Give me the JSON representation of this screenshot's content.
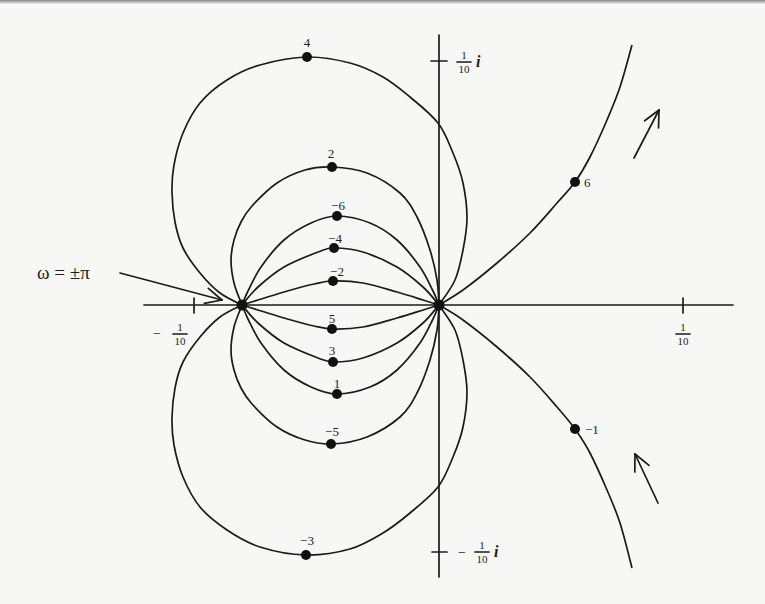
{
  "figure": {
    "annotation": {
      "text": "ω = ±π",
      "text_at": [
        37,
        279
      ],
      "arrow": {
        "from": [
          120,
          273
        ],
        "to": [
          222,
          300
        ]
      }
    },
    "axes": {
      "real": {
        "from": [
          144,
          305
        ],
        "to": [
          733,
          305
        ]
      },
      "imaginary": {
        "from": [
          439,
          35
        ],
        "to": [
          439,
          577
        ]
      },
      "origin": [
        439,
        305
      ],
      "scale_px_per_tenth": 245
    },
    "ticks": [
      {
        "name": "tick-real-minus-tenth",
        "line": [
          [
            194,
            298
          ],
          [
            194,
            313
          ]
        ],
        "sign": "−",
        "sign_at": [
          157,
          338
        ],
        "num": "1",
        "den": "10",
        "frac_x": 180,
        "bar_y": 334,
        "suffix": "",
        "suffix_at": [
          0,
          0
        ]
      },
      {
        "name": "tick-real-plus-tenth",
        "line": [
          [
            683,
            298
          ],
          [
            683,
            313
          ]
        ],
        "sign": "",
        "sign_at": [
          0,
          0
        ],
        "num": "1",
        "den": "10",
        "frac_x": 683,
        "bar_y": 334,
        "suffix": "",
        "suffix_at": [
          0,
          0
        ]
      },
      {
        "name": "tick-imag-plus-tenth",
        "line": [
          [
            431,
            61
          ],
          [
            447,
            61
          ]
        ],
        "sign": "",
        "sign_at": [
          0,
          0
        ],
        "num": "1",
        "den": "10",
        "frac_x": 464,
        "bar_y": 62,
        "suffix": "i",
        "suffix_at": [
          476,
          67
        ]
      },
      {
        "name": "tick-imag-minus-tenth",
        "line": [
          [
            432,
            552
          ],
          [
            447,
            552
          ]
        ],
        "sign": "−",
        "sign_at": [
          462,
          557
        ],
        "num": "1",
        "den": "10",
        "frac_x": 482,
        "bar_y": 552,
        "suffix": "i",
        "suffix_at": [
          494,
          557
        ]
      }
    ],
    "special_points": [
      {
        "name": "point-omega-pm-pi",
        "at": [
          242,
          305
        ]
      },
      {
        "name": "point-origin",
        "at": [
          439,
          305
        ]
      }
    ],
    "curves": [
      {
        "label": "4",
        "dot": [
          307,
          57
        ],
        "label_at": [
          307,
          47
        ],
        "anchor": "middle",
        "points": [
          [
            242,
            305
          ],
          [
            220,
            293
          ],
          [
            200,
            273
          ],
          [
            183,
            248
          ],
          [
            175,
            222
          ],
          [
            172,
            192
          ],
          [
            174,
            165
          ],
          [
            183,
            133
          ],
          [
            200,
            103
          ],
          [
            227,
            80
          ],
          [
            260,
            65
          ],
          [
            307,
            57
          ],
          [
            350,
            63
          ],
          [
            383,
            77
          ],
          [
            410,
            97
          ],
          [
            438,
            123
          ],
          [
            453,
            153
          ],
          [
            463,
            183
          ],
          [
            467,
            218
          ],
          [
            463,
            250
          ],
          [
            455,
            280
          ],
          [
            439,
            305
          ]
        ]
      },
      {
        "label": "2",
        "dot": [
          332,
          167
        ],
        "label_at": [
          331,
          158
        ],
        "anchor": "middle",
        "points": [
          [
            242,
            305
          ],
          [
            234,
            283
          ],
          [
            231,
            260
          ],
          [
            234,
            240
          ],
          [
            241,
            222
          ],
          [
            252,
            206
          ],
          [
            277,
            183
          ],
          [
            305,
            170
          ],
          [
            332,
            167
          ],
          [
            367,
            173
          ],
          [
            400,
            193
          ],
          [
            417,
            217
          ],
          [
            430,
            250
          ],
          [
            437,
            280
          ],
          [
            439,
            305
          ]
        ]
      },
      {
        "label": "−6",
        "dot": [
          337,
          216
        ],
        "label_at": [
          338,
          210
        ],
        "anchor": "middle",
        "points": [
          [
            242,
            305
          ],
          [
            248,
            291
          ],
          [
            261,
            267
          ],
          [
            284,
            240
          ],
          [
            311,
            223
          ],
          [
            337,
            216
          ],
          [
            370,
            223
          ],
          [
            397,
            240
          ],
          [
            420,
            267
          ],
          [
            433,
            291
          ],
          [
            439,
            305
          ]
        ]
      },
      {
        "label": "−4",
        "dot": [
          334,
          248
        ],
        "label_at": [
          335,
          243
        ],
        "anchor": "middle",
        "points": [
          [
            242,
            305
          ],
          [
            258,
            287
          ],
          [
            284,
            267
          ],
          [
            318,
            252
          ],
          [
            334,
            248
          ],
          [
            363,
            252
          ],
          [
            397,
            267
          ],
          [
            423,
            287
          ],
          [
            439,
            305
          ]
        ]
      },
      {
        "label": "−2",
        "dot": [
          333,
          281
        ],
        "label_at": [
          337,
          276
        ],
        "anchor": "middle",
        "points": [
          [
            242,
            305
          ],
          [
            258,
            300
          ],
          [
            284,
            292
          ],
          [
            314,
            284
          ],
          [
            333,
            281
          ],
          [
            363,
            283
          ],
          [
            397,
            292
          ],
          [
            423,
            300
          ],
          [
            439,
            305
          ]
        ]
      },
      {
        "label": "5",
        "dot": [
          332,
          329
        ],
        "label_at": [
          332,
          323
        ],
        "anchor": "middle",
        "points": [
          [
            242,
            305
          ],
          [
            258,
            310
          ],
          [
            284,
            318
          ],
          [
            314,
            326
          ],
          [
            333,
            329
          ],
          [
            363,
            327
          ],
          [
            397,
            318
          ],
          [
            423,
            310
          ],
          [
            439,
            305
          ]
        ]
      },
      {
        "label": "3",
        "dot": [
          333,
          362
        ],
        "label_at": [
          332,
          355
        ],
        "anchor": "middle",
        "points": [
          [
            242,
            305
          ],
          [
            258,
            323
          ],
          [
            284,
            343
          ],
          [
            318,
            358
          ],
          [
            334,
            362
          ],
          [
            363,
            358
          ],
          [
            397,
            343
          ],
          [
            423,
            323
          ],
          [
            439,
            305
          ]
        ]
      },
      {
        "label": "1",
        "dot": [
          337,
          394
        ],
        "label_at": [
          337,
          388
        ],
        "anchor": "middle",
        "points": [
          [
            242,
            305
          ],
          [
            248,
            319
          ],
          [
            261,
            343
          ],
          [
            284,
            370
          ],
          [
            311,
            387
          ],
          [
            337,
            394
          ],
          [
            370,
            387
          ],
          [
            397,
            370
          ],
          [
            420,
            343
          ],
          [
            433,
            319
          ],
          [
            439,
            305
          ]
        ]
      },
      {
        "label": "−5",
        "dot": [
          331,
          444
        ],
        "label_at": [
          332,
          436
        ],
        "anchor": "middle",
        "points": [
          [
            242,
            305
          ],
          [
            234,
            327
          ],
          [
            231,
            350
          ],
          [
            234,
            370
          ],
          [
            241,
            388
          ],
          [
            252,
            404
          ],
          [
            277,
            427
          ],
          [
            305,
            440
          ],
          [
            332,
            444
          ],
          [
            367,
            437
          ],
          [
            400,
            417
          ],
          [
            417,
            393
          ],
          [
            430,
            360
          ],
          [
            437,
            330
          ],
          [
            439,
            305
          ]
        ]
      },
      {
        "label": "−3",
        "dot": [
          306,
          555
        ],
        "label_at": [
          307,
          545
        ],
        "anchor": "middle",
        "points": [
          [
            242,
            305
          ],
          [
            220,
            317
          ],
          [
            200,
            337
          ],
          [
            183,
            362
          ],
          [
            175,
            388
          ],
          [
            172,
            418
          ],
          [
            174,
            445
          ],
          [
            183,
            477
          ],
          [
            200,
            507
          ],
          [
            227,
            530
          ],
          [
            260,
            547
          ],
          [
            306,
            555
          ],
          [
            350,
            549
          ],
          [
            383,
            533
          ],
          [
            410,
            513
          ],
          [
            438,
            487
          ],
          [
            453,
            457
          ],
          [
            463,
            427
          ],
          [
            467,
            392
          ],
          [
            463,
            360
          ],
          [
            455,
            330
          ],
          [
            439,
            305
          ]
        ]
      },
      {
        "label": "6",
        "dot": [
          575,
          182
        ],
        "label_at": [
          584,
          187
        ],
        "anchor": "start",
        "points": [
          [
            439,
            305
          ],
          [
            463,
            290
          ],
          [
            497,
            263
          ],
          [
            530,
            233
          ],
          [
            557,
            203
          ],
          [
            575,
            182
          ],
          [
            590,
            157
          ],
          [
            607,
            120
          ],
          [
            620,
            87
          ],
          [
            632,
            45
          ]
        ]
      },
      {
        "label": "−1",
        "dot": [
          575,
          429
        ],
        "label_at": [
          585,
          434
        ],
        "anchor": "start",
        "points": [
          [
            439,
            305
          ],
          [
            463,
            320
          ],
          [
            497,
            347
          ],
          [
            530,
            377
          ],
          [
            557,
            407
          ],
          [
            575,
            429
          ],
          [
            590,
            453
          ],
          [
            607,
            490
          ],
          [
            620,
            523
          ],
          [
            632,
            568
          ]
        ]
      }
    ],
    "direction_arrows": [
      {
        "name": "direction-arrow-upper",
        "from": [
          634,
          158
        ],
        "to": [
          659,
          110
        ]
      },
      {
        "name": "direction-arrow-lower",
        "from": [
          658,
          503
        ],
        "to": [
          635,
          454
        ]
      }
    ]
  }
}
